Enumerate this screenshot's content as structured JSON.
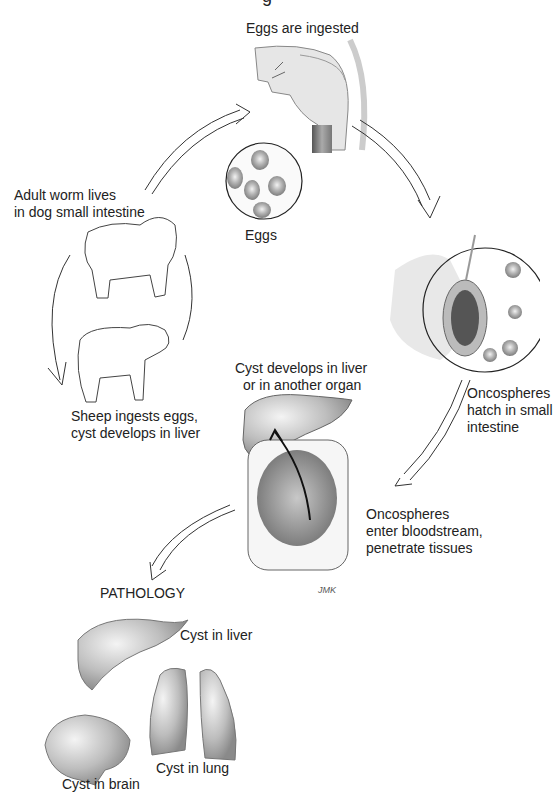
{
  "diagram": {
    "title_fragment": "g",
    "stages": {
      "eggs_ingested": {
        "label": "Eggs are ingested"
      },
      "eggs": {
        "label": "Eggs"
      },
      "adult_worm": {
        "lines": [
          "Adult worm lives",
          "in dog small intestine"
        ]
      },
      "sheep": {
        "lines": [
          "Sheep ingests eggs,",
          "cyst develops in liver"
        ]
      },
      "oncospheres_hatch": {
        "lines": [
          "Oncospheres",
          "hatch in small",
          "intestine"
        ]
      },
      "cyst_develops": {
        "lines": [
          "Cyst develops in liver",
          "or in another organ"
        ]
      },
      "oncospheres_enter": {
        "lines": [
          "Oncospheres",
          "enter bloodstream,",
          "penetrate tissues"
        ]
      }
    },
    "pathology": {
      "heading": "PATHOLOGY",
      "items": [
        {
          "label": "Cyst in liver"
        },
        {
          "label": "Cyst in lung"
        },
        {
          "label": "Cyst in brain"
        }
      ]
    },
    "signature": "JMK"
  }
}
